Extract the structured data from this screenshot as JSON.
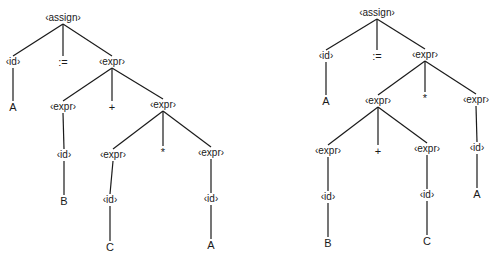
{
  "diagram": {
    "type": "parse-tree-comparison",
    "trees": [
      {
        "id": "left",
        "nodes": [
          {
            "key": "L0",
            "label": "‹assign›",
            "x": 63,
            "y": 18,
            "kind": "nonterminal"
          },
          {
            "key": "L1",
            "label": "‹id›",
            "x": 13,
            "y": 62,
            "kind": "nonterminal"
          },
          {
            "key": "L2",
            "label": ":=",
            "x": 63,
            "y": 62,
            "kind": "terminal"
          },
          {
            "key": "L3",
            "label": "‹expr›",
            "x": 112,
            "y": 62,
            "kind": "nonterminal"
          },
          {
            "key": "L4",
            "label": "A",
            "x": 13,
            "y": 107,
            "kind": "terminal"
          },
          {
            "key": "L5",
            "label": "‹expr›",
            "x": 63,
            "y": 107,
            "kind": "nonterminal"
          },
          {
            "key": "L6",
            "label": "+",
            "x": 112,
            "y": 107,
            "kind": "terminal"
          },
          {
            "key": "L7",
            "label": "‹expr›",
            "x": 163,
            "y": 105,
            "kind": "nonterminal"
          },
          {
            "key": "L8",
            "label": "‹id›",
            "x": 64,
            "y": 155,
            "kind": "nonterminal"
          },
          {
            "key": "L9",
            "label": "‹expr›",
            "x": 113,
            "y": 155,
            "kind": "nonterminal"
          },
          {
            "key": "L10",
            "label": "*",
            "x": 163,
            "y": 152,
            "kind": "terminal"
          },
          {
            "key": "L11",
            "label": "‹expr›",
            "x": 211,
            "y": 153,
            "kind": "nonterminal"
          },
          {
            "key": "L12",
            "label": "B",
            "x": 64,
            "y": 201,
            "kind": "terminal"
          },
          {
            "key": "L13",
            "label": "‹id›",
            "x": 110,
            "y": 200,
            "kind": "nonterminal"
          },
          {
            "key": "L14",
            "label": "‹id›",
            "x": 211,
            "y": 199,
            "kind": "nonterminal"
          },
          {
            "key": "L15",
            "label": "C",
            "x": 110,
            "y": 247,
            "kind": "terminal"
          },
          {
            "key": "L16",
            "label": "A",
            "x": 211,
            "y": 245,
            "kind": "terminal"
          }
        ],
        "edges": [
          [
            "L0",
            "L1"
          ],
          [
            "L0",
            "L2"
          ],
          [
            "L0",
            "L3"
          ],
          [
            "L1",
            "L4"
          ],
          [
            "L3",
            "L5"
          ],
          [
            "L3",
            "L6"
          ],
          [
            "L3",
            "L7"
          ],
          [
            "L5",
            "L8"
          ],
          [
            "L7",
            "L9"
          ],
          [
            "L7",
            "L10"
          ],
          [
            "L7",
            "L11"
          ],
          [
            "L8",
            "L12"
          ],
          [
            "L9",
            "L13"
          ],
          [
            "L11",
            "L14"
          ],
          [
            "L13",
            "L15"
          ],
          [
            "L14",
            "L16"
          ]
        ]
      },
      {
        "id": "right",
        "nodes": [
          {
            "key": "R0",
            "label": "‹assign›",
            "x": 377,
            "y": 13,
            "kind": "nonterminal"
          },
          {
            "key": "R1",
            "label": "‹id›",
            "x": 326,
            "y": 56,
            "kind": "nonterminal"
          },
          {
            "key": "R2",
            "label": ":=",
            "x": 377,
            "y": 56,
            "kind": "terminal"
          },
          {
            "key": "R3",
            "label": "‹expr›",
            "x": 425,
            "y": 55,
            "kind": "nonterminal"
          },
          {
            "key": "R4",
            "label": "A",
            "x": 326,
            "y": 101,
            "kind": "terminal"
          },
          {
            "key": "R5",
            "label": "‹expr›",
            "x": 378,
            "y": 101,
            "kind": "nonterminal"
          },
          {
            "key": "R6",
            "label": "*",
            "x": 425,
            "y": 98,
            "kind": "terminal"
          },
          {
            "key": "R7",
            "label": "‹expr›",
            "x": 476,
            "y": 100,
            "kind": "nonterminal"
          },
          {
            "key": "R8",
            "label": "‹expr›",
            "x": 328,
            "y": 151,
            "kind": "nonterminal"
          },
          {
            "key": "R9",
            "label": "+",
            "x": 378,
            "y": 151,
            "kind": "terminal"
          },
          {
            "key": "R10",
            "label": "‹expr›",
            "x": 427,
            "y": 149,
            "kind": "nonterminal"
          },
          {
            "key": "R11",
            "label": "‹id›",
            "x": 477,
            "y": 148,
            "kind": "nonterminal"
          },
          {
            "key": "R12",
            "label": "‹id›",
            "x": 328,
            "y": 197,
            "kind": "nonterminal"
          },
          {
            "key": "R13",
            "label": "‹id›",
            "x": 427,
            "y": 195,
            "kind": "nonterminal"
          },
          {
            "key": "R14",
            "label": "A",
            "x": 477,
            "y": 194,
            "kind": "terminal"
          },
          {
            "key": "R15",
            "label": "B",
            "x": 328,
            "y": 243,
            "kind": "terminal"
          },
          {
            "key": "R16",
            "label": "C",
            "x": 427,
            "y": 241,
            "kind": "terminal"
          }
        ],
        "edges": [
          [
            "R0",
            "R1"
          ],
          [
            "R0",
            "R2"
          ],
          [
            "R0",
            "R3"
          ],
          [
            "R1",
            "R4"
          ],
          [
            "R3",
            "R5"
          ],
          [
            "R3",
            "R6"
          ],
          [
            "R3",
            "R7"
          ],
          [
            "R5",
            "R8"
          ],
          [
            "R5",
            "R9"
          ],
          [
            "R5",
            "R10"
          ],
          [
            "R7",
            "R11"
          ],
          [
            "R8",
            "R12"
          ],
          [
            "R10",
            "R13"
          ],
          [
            "R11",
            "R14"
          ],
          [
            "R12",
            "R15"
          ],
          [
            "R13",
            "R16"
          ]
        ]
      }
    ]
  },
  "colors": {
    "background": "#ffffff",
    "ink": "#1a1a1a"
  }
}
